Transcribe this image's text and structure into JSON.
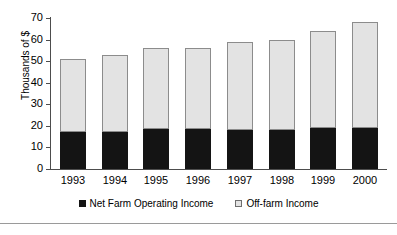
{
  "chart_data": {
    "type": "bar",
    "stacked": true,
    "title": "",
    "xlabel": "",
    "ylabel": "Thousands of $",
    "ylim": [
      0,
      70
    ],
    "yticks": [
      0,
      10,
      20,
      30,
      40,
      50,
      60,
      70
    ],
    "grid": false,
    "legend_position": "bottom",
    "categories": [
      "1993",
      "1994",
      "1995",
      "1996",
      "1997",
      "1998",
      "1999",
      "2000"
    ],
    "series": [
      {
        "name": "Net Farm Operating Income",
        "color": "#141414",
        "values": [
          17,
          17,
          18.5,
          18.5,
          18,
          18,
          19,
          19
        ]
      },
      {
        "name": "Off-farm Income",
        "color": "#e3e3e3",
        "values": [
          34,
          36,
          37.5,
          37.5,
          41,
          42,
          45,
          49
        ]
      }
    ],
    "totals": [
      51,
      53,
      56,
      56,
      59,
      60,
      64,
      68
    ]
  },
  "legend": {
    "items": [
      {
        "label": "Net Farm Operating Income",
        "swatch": "filled-black-square-icon"
      },
      {
        "label": "Off-farm Income",
        "swatch": "empty-light-square-icon"
      }
    ]
  }
}
